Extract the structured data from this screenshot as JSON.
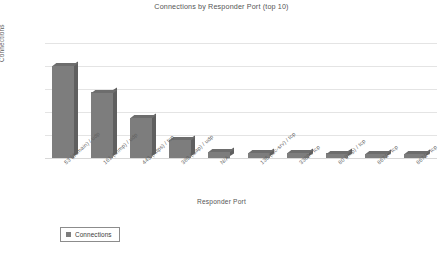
{
  "chart_data": {
    "type": "bar",
    "title": "Connections by Responder Port (top 10)",
    "xlabel": "Responder Port",
    "ylabel": "Connections",
    "ylim": [
      0,
      5000000
    ],
    "ytick_labels": [
      "5000000",
      "4000000",
      "3000000",
      "2000000",
      "1000000",
      "0"
    ],
    "ytick_values": [
      5000000,
      4000000,
      3000000,
      2000000,
      1000000,
      0
    ],
    "grid": true,
    "legend_position": "bottom-left",
    "categories": [
      "53 (domain) / udp",
      "161 (snmp) / udp",
      "443 (https) / tcp",
      "389 (ldap) / udp",
      "N/A",
      "135 (loc-srv) / tcp",
      "3389 / tcp",
      "80 (http) / tcp",
      "8671 / tcp",
      "8671 / tcp"
    ],
    "series": [
      {
        "name": "Connections",
        "values": [
          4020000,
          2850000,
          1760000,
          800000,
          260000,
          230000,
          215000,
          200000,
          190000,
          180000
        ]
      }
    ],
    "bar_color": "#7d7d7d",
    "bar_side_color": "#5f5f5f",
    "bar_top_color": "#6d6d6d"
  },
  "legend": {
    "entries": [
      {
        "label": "Connections",
        "color": "#7d7d7d"
      }
    ]
  }
}
